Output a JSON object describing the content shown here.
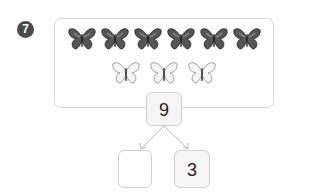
{
  "problem": {
    "number": "7"
  },
  "picture": {
    "dark_butterflies": 6,
    "light_butterflies": 3
  },
  "number_bond": {
    "whole": "9",
    "part_left": "",
    "part_right": "3"
  }
}
